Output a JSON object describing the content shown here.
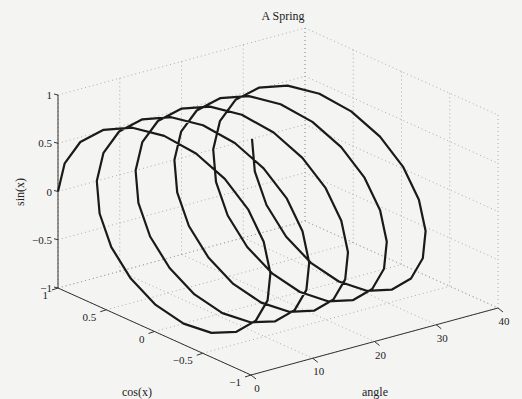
{
  "chart_data": {
    "type": "line3d",
    "title": "A Spring",
    "xlabel": "cos(x)",
    "ylabel": "angle",
    "zlabel": "sin(x)",
    "xlim": [
      -1,
      1
    ],
    "ylim": [
      0,
      40
    ],
    "zlim": [
      -1,
      1
    ],
    "xticks": [
      "1",
      "0.5",
      "0",
      "-0.5",
      "-1"
    ],
    "xtick_values": [
      1,
      0.5,
      0,
      -0.5,
      -1
    ],
    "yticks": [
      "0",
      "10",
      "20",
      "30",
      "40"
    ],
    "ytick_values": [
      0,
      10,
      20,
      30,
      40
    ],
    "zticks": [
      "1",
      "0.5",
      "0",
      "-0.5",
      "-1"
    ],
    "ztick_values": [
      1,
      0.5,
      0,
      -0.5,
      -1
    ],
    "grid": true,
    "series": [
      {
        "name": "spring",
        "param": "angle t from 0 to 10π (5 turns), step π/10",
        "x": "cos(t)",
        "y": "t",
        "z": "sin(t)",
        "t_start": 0,
        "t_end": 31.4159,
        "t_steps": 100,
        "color": "#1a1a1a"
      }
    ]
  },
  "colors": {
    "background": "#f4f4f2",
    "axis": "#333333",
    "grid": "#9a9a9a",
    "line": "#1a1a1a"
  }
}
